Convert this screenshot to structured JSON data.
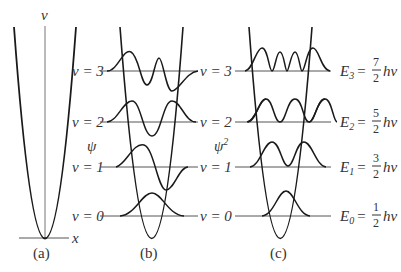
{
  "figure": {
    "panels": [
      {
        "id": "a",
        "caption": "(a)",
        "axis_top_label": "v",
        "axis_right_label": "x"
      },
      {
        "id": "b",
        "caption": "(b)",
        "axis_label": "ψ"
      },
      {
        "id": "c",
        "caption": "(c)",
        "axis_label": "ψ",
        "axis_label_sup": "2"
      }
    ],
    "levels": [
      {
        "n": "3",
        "left_label": "v = 3",
        "right_label": "v = 3",
        "energy_sub": "3",
        "energy_num": "7",
        "energy_den": "2"
      },
      {
        "n": "2",
        "left_label": "v = 2",
        "right_label": "v = 2",
        "energy_sub": "2",
        "energy_num": "5",
        "energy_den": "2"
      },
      {
        "n": "1",
        "left_label": "v = 1",
        "right_label": "v = 1",
        "energy_sub": "1",
        "energy_num": "3",
        "energy_den": "2"
      },
      {
        "n": "0",
        "left_label": "v = 0",
        "right_label": "v = 0",
        "energy_sub": "0",
        "energy_num": "1",
        "energy_den": "2"
      }
    ],
    "energy": {
      "symbol": "E",
      "eq": "=",
      "suffix": "hν"
    },
    "colors": {
      "curve": "#1a1a1a",
      "line": "#555555",
      "text": "#333333"
    }
  }
}
